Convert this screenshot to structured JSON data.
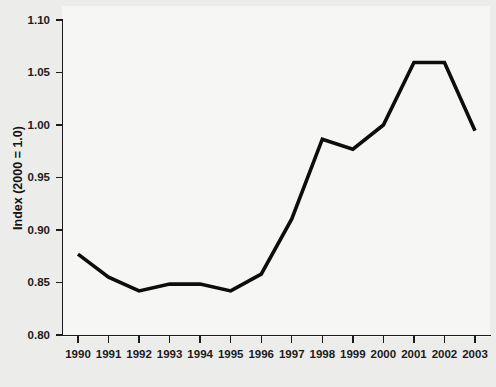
{
  "chart_data": {
    "type": "line",
    "title": "",
    "subtitle": "",
    "xlabel": "",
    "ylabel": "Index (2000 = 1.0)",
    "categories": [
      "1990",
      "1991",
      "1992",
      "1993",
      "1994",
      "1995",
      "1996",
      "1997",
      "1998",
      "1999",
      "2000",
      "2001",
      "2002",
      "2003"
    ],
    "x": [
      1990,
      1991,
      1992,
      1993,
      1994,
      1995,
      1996,
      1997,
      1998,
      1999,
      2000,
      2001,
      2002,
      2003
    ],
    "values": [
      0.877,
      0.855,
      0.842,
      0.8485,
      0.8485,
      0.842,
      0.858,
      0.9105,
      0.9865,
      0.977,
      1.0,
      1.0595,
      1.0595,
      0.9945
    ],
    "series": [
      {
        "name": "Index",
        "values": [
          0.877,
          0.855,
          0.842,
          0.8485,
          0.8485,
          0.842,
          0.858,
          0.9105,
          0.9865,
          0.977,
          1.0,
          1.0595,
          1.0595,
          0.9945
        ]
      }
    ],
    "ylim": [
      0.8,
      1.1
    ],
    "xlim": [
      1990,
      2003
    ],
    "ytick_labels": [
      "0.80",
      "0.85",
      "0.90",
      "0.95",
      "1.00",
      "1.05",
      "1.10"
    ],
    "ytick_values": [
      0.8,
      0.85,
      0.9,
      0.95,
      1.0,
      1.05,
      1.1
    ],
    "xtick_labels": [
      "1990",
      "1991",
      "1992",
      "1993",
      "1994",
      "1995",
      "1996",
      "1997",
      "1998",
      "1999",
      "2000",
      "2001",
      "2002",
      "2003"
    ],
    "grid": false,
    "legend": false,
    "legend_position": "none",
    "line_color": "#0d0d0d",
    "axis_color": "#1b1b1b",
    "background_color": "#ededea",
    "plot_background_color": "#f6f6f5"
  }
}
